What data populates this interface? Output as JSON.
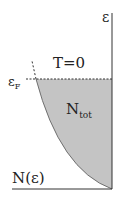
{
  "diagram": {
    "axis_labels": {
      "y": "ε",
      "x": "N(ε)"
    },
    "annotations": {
      "temperature": "T=0",
      "fermi_level": "ε",
      "fermi_level_sub": "F",
      "region": "N",
      "region_sub": "tot"
    },
    "colors": {
      "fill": "#c4c4c4",
      "line": "#333333"
    }
  }
}
